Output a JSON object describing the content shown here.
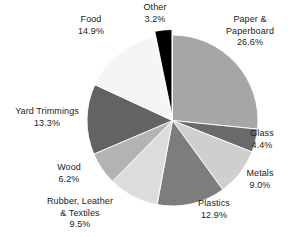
{
  "chart_data": {
    "type": "pie",
    "title": "",
    "subtitle": "",
    "xlabel": "",
    "ylabel": "",
    "legend_position": "none",
    "grid": false,
    "units": "percent",
    "total": 100.0,
    "categories": [
      "Paper & Paperboard",
      "Glass",
      "Metals",
      "Plastics",
      "Rubber, Leather & Textiles",
      "Wood",
      "Yard Trimmings",
      "Food",
      "Other"
    ],
    "values": [
      26.6,
      4.4,
      9.0,
      12.9,
      9.5,
      6.2,
      13.3,
      14.9,
      3.2
    ],
    "colors": [
      "#a6a6a6",
      "#6a6a6a",
      "#cfcfcf",
      "#7d7d7d",
      "#dcdcdc",
      "#b3b3b3",
      "#636363",
      "#f5f5f5",
      "#000000"
    ],
    "slices": [
      {
        "name": "Paper & Paperboard",
        "value": 26.6,
        "value_label": "26.6%",
        "color": "#a6a6a6",
        "start_deg": 0.0,
        "end_deg": 95.8,
        "exploded": false
      },
      {
        "name": "Glass",
        "value": 4.4,
        "value_label": "4.4%",
        "color": "#6a6a6a",
        "start_deg": 95.8,
        "end_deg": 111.6,
        "exploded": false
      },
      {
        "name": "Metals",
        "value": 9.0,
        "value_label": "9.0%",
        "color": "#cfcfcf",
        "start_deg": 111.6,
        "end_deg": 144.0,
        "exploded": false
      },
      {
        "name": "Plastics",
        "value": 12.9,
        "value_label": "12.9%",
        "color": "#7d7d7d",
        "start_deg": 144.0,
        "end_deg": 190.4,
        "exploded": false
      },
      {
        "name": "Rubber, Leather & Textiles",
        "value": 9.5,
        "value_label": "9.5%",
        "color": "#dcdcdc",
        "start_deg": 190.4,
        "end_deg": 224.6,
        "exploded": false
      },
      {
        "name": "Wood",
        "value": 6.2,
        "value_label": "6.2%",
        "color": "#b3b3b3",
        "start_deg": 224.6,
        "end_deg": 246.9,
        "exploded": false
      },
      {
        "name": "Yard Trimmings",
        "value": 13.3,
        "value_label": "13.3%",
        "color": "#636363",
        "start_deg": 246.9,
        "end_deg": 294.8,
        "exploded": false
      },
      {
        "name": "Food",
        "value": 14.9,
        "value_label": "14.9%",
        "color": "#f5f5f5",
        "start_deg": 294.8,
        "end_deg": 348.4,
        "exploded": false
      },
      {
        "name": "Other",
        "value": 3.2,
        "value_label": "3.2%",
        "color": "#000000",
        "start_deg": 348.4,
        "end_deg": 360.0,
        "exploded": true
      }
    ]
  },
  "labels": {
    "paper": {
      "name": "Paper &",
      "name2": "Paperboard",
      "pct": "26.6%"
    },
    "glass": {
      "name": "Glass",
      "pct": "4.4%"
    },
    "metals": {
      "name": "Metals",
      "pct": "9.0%"
    },
    "plastics": {
      "name": "Plastics",
      "pct": "12.9%"
    },
    "rubber": {
      "name": "Rubber, Leather",
      "name2": "& Textiles",
      "pct": "9.5%"
    },
    "wood": {
      "name": "Wood",
      "pct": "6.2%"
    },
    "yard": {
      "name": "Yard Trimmings",
      "pct": "13.3%"
    },
    "food": {
      "name": "Food",
      "pct": "14.9%"
    },
    "other": {
      "name": "Other",
      "pct": "3.2%"
    }
  }
}
